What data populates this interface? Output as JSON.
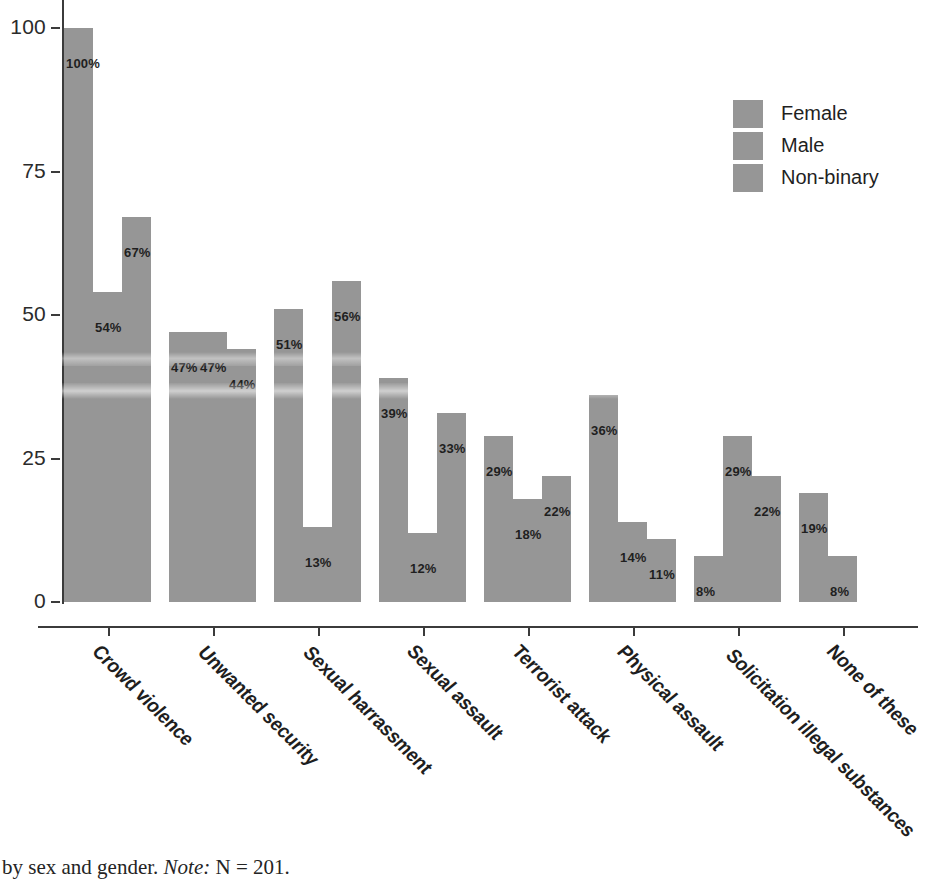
{
  "chart_data": {
    "type": "bar",
    "title": "",
    "xlabel": "",
    "ylabel": "",
    "ylim": [
      0,
      100
    ],
    "ytick_labels": [
      "100",
      "75",
      "50",
      "25",
      "0"
    ],
    "ytick_values": [
      100,
      75,
      50,
      25,
      0
    ],
    "grid": false,
    "legend_position": "top-right",
    "categories": [
      "Crowd violence",
      "Unwanted security",
      "Sexual harrassment",
      "Sexual assault",
      "Terrorist attack",
      "Physical assault",
      "Solicitation illegal substances",
      "None of these"
    ],
    "series": [
      {
        "name": "Female",
        "color": "#969696",
        "values": [
          100,
          47,
          51,
          39,
          29,
          36,
          8,
          19
        ],
        "labels": [
          "100%",
          "47%",
          "51%",
          "39%",
          "29%",
          "36%",
          "8%",
          "19%"
        ]
      },
      {
        "name": "Male",
        "color": "#969696",
        "values": [
          54,
          47,
          13,
          12,
          18,
          14,
          29,
          8
        ],
        "labels": [
          "54%",
          "47%",
          "13%",
          "12%",
          "18%",
          "14%",
          "29%",
          "8%"
        ]
      },
      {
        "name": "Non-binary",
        "color": "#969696",
        "values": [
          67,
          44,
          56,
          33,
          22,
          11,
          22,
          0
        ],
        "labels": [
          "67%",
          "44%",
          "56%",
          "33%",
          "22%",
          "11%",
          "22%",
          ""
        ]
      }
    ]
  },
  "legend": {
    "items": [
      {
        "label": "Female",
        "color": "#969696"
      },
      {
        "label": "Male",
        "color": "#969696"
      },
      {
        "label": "Non-binary",
        "color": "#969696"
      }
    ]
  },
  "caption": {
    "lead": "ncerns by sex and gender.",
    "note_word": "Note:",
    "note_text": " N = 201."
  }
}
